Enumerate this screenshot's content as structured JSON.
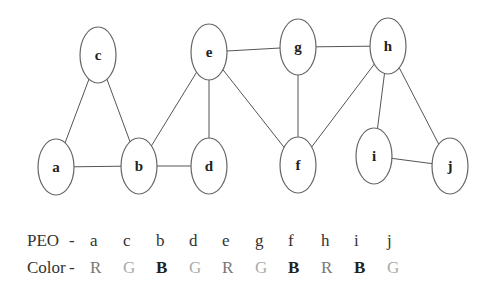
{
  "graph": {
    "nodes": [
      {
        "id": "a",
        "x": 56,
        "y": 167
      },
      {
        "id": "b",
        "x": 139,
        "y": 166
      },
      {
        "id": "c",
        "x": 98,
        "y": 55
      },
      {
        "id": "d",
        "x": 209,
        "y": 166
      },
      {
        "id": "e",
        "x": 209,
        "y": 52
      },
      {
        "id": "f",
        "x": 298,
        "y": 165
      },
      {
        "id": "g",
        "x": 298,
        "y": 47
      },
      {
        "id": "h",
        "x": 388,
        "y": 46
      },
      {
        "id": "i",
        "x": 374,
        "y": 156
      },
      {
        "id": "j",
        "x": 450,
        "y": 166
      }
    ],
    "edges": [
      [
        "a",
        "c"
      ],
      [
        "a",
        "b"
      ],
      [
        "c",
        "b"
      ],
      [
        "b",
        "e"
      ],
      [
        "b",
        "d"
      ],
      [
        "e",
        "d"
      ],
      [
        "e",
        "g"
      ],
      [
        "e",
        "f"
      ],
      [
        "g",
        "f"
      ],
      [
        "g",
        "h"
      ],
      [
        "h",
        "f"
      ],
      [
        "h",
        "i"
      ],
      [
        "h",
        "j"
      ],
      [
        "i",
        "j"
      ]
    ]
  },
  "legend": {
    "peo_label": "PEO",
    "color_label": "Color",
    "separator": "-",
    "order": [
      "a",
      "c",
      "b",
      "d",
      "e",
      "g",
      "f",
      "h",
      "i",
      "j"
    ],
    "colors": [
      "R",
      "G",
      "B",
      "G",
      "R",
      "G",
      "B",
      "R",
      "B",
      "G"
    ]
  }
}
